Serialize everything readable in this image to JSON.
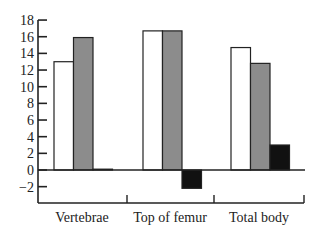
{
  "chart_data": {
    "type": "bar",
    "title": "",
    "xlabel": "",
    "ylabel": "",
    "categories": [
      "Vertebrae",
      "Top of femur",
      "Total body"
    ],
    "series": [
      {
        "name": "white",
        "color": "#ffffff",
        "values": [
          13.0,
          16.7,
          14.7
        ]
      },
      {
        "name": "gray",
        "color": "#8c8c8c",
        "values": [
          15.9,
          16.7,
          12.8
        ]
      },
      {
        "name": "black",
        "color": "#111111",
        "values": [
          0.1,
          -2.2,
          3.0
        ]
      }
    ],
    "ylim": [
      -4,
      18
    ],
    "yticks": [
      18,
      16,
      14,
      12,
      10,
      8,
      6,
      4,
      2,
      0,
      -2
    ],
    "ytick_labels": [
      "18",
      "16",
      "14",
      "12",
      "10",
      "8",
      "6",
      "4",
      "2",
      "0",
      "−2"
    ],
    "grid": false,
    "legend": null
  }
}
